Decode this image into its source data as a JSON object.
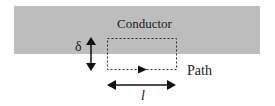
{
  "diagram": {
    "conductor_label": "Conductor",
    "delta_label": "δ",
    "path_label": "Path",
    "length_label": "l",
    "colors": {
      "conductor_fill": "#bdbdbd",
      "line": "#111111",
      "background": "#ffffff"
    }
  }
}
